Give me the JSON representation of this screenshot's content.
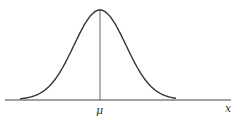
{
  "chart_data": {
    "type": "line",
    "xlabel": "x",
    "ylabel": "",
    "mean_label": "μ",
    "grid": false
  },
  "labels": {
    "mean": "μ",
    "x_axis": "x"
  },
  "colors": {
    "stroke": "#333333",
    "background": "#ffffff"
  }
}
